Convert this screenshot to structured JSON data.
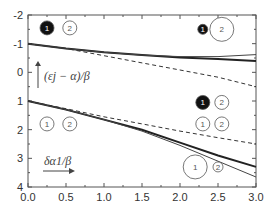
{
  "chart_data": {
    "type": "line",
    "title": "",
    "xlabel": "",
    "ylabel": "",
    "xlim": [
      0.0,
      3.0
    ],
    "ylim": [
      -2,
      4
    ],
    "y_inverted": true,
    "x_ticks": [
      "0.0",
      "0.5",
      "1.0",
      "1.5",
      "2.0",
      "2.5",
      "3.0"
    ],
    "y_ticks": [
      "-2",
      "-1",
      "0",
      "1",
      "2",
      "3",
      "4"
    ],
    "grid": false,
    "series": [
      {
        "name": "upper-thick",
        "style": "solid-thick",
        "x": [
          0,
          0.5,
          1.0,
          1.5,
          2.0,
          2.5,
          3.0
        ],
        "y": [
          -1.0,
          -0.83,
          -0.7,
          -0.6,
          -0.52,
          -0.46,
          -0.4
        ]
      },
      {
        "name": "upper-thin",
        "style": "solid-thin",
        "x": [
          0,
          0.5,
          1.0,
          1.5,
          2.0,
          2.5,
          3.0
        ],
        "y": [
          -1.0,
          -0.83,
          -0.7,
          -0.6,
          -0.55,
          -0.55,
          -0.62
        ]
      },
      {
        "name": "upper-dashed",
        "style": "dashed",
        "x": [
          0,
          0.5,
          1.0,
          1.5,
          2.0,
          2.5,
          3.0
        ],
        "y": [
          -1.0,
          -0.83,
          -0.58,
          -0.33,
          -0.08,
          0.17,
          0.5
        ]
      },
      {
        "name": "lower-thick",
        "style": "solid-thick",
        "x": [
          0,
          0.5,
          1.0,
          1.5,
          2.0,
          2.5,
          3.0
        ],
        "y": [
          1.0,
          1.3,
          1.65,
          2.0,
          2.45,
          2.9,
          3.3
        ]
      },
      {
        "name": "lower-thin",
        "style": "solid-thin",
        "x": [
          0,
          0.5,
          1.0,
          1.5,
          2.0,
          2.5,
          3.0
        ],
        "y": [
          1.0,
          1.3,
          1.65,
          2.05,
          2.55,
          3.1,
          3.65
        ]
      },
      {
        "name": "lower-dashed",
        "style": "dashed",
        "x": [
          0,
          0.5,
          1.0,
          1.5,
          2.0,
          2.5,
          3.0
        ],
        "y": [
          1.0,
          1.27,
          1.55,
          1.8,
          2.05,
          2.28,
          2.5
        ]
      }
    ],
    "annotations": [
      {
        "text": "(ε_j − α)/β",
        "x": 0.3,
        "y": 0.3,
        "arrow": "up"
      },
      {
        "text": "δα_1/β",
        "x": 0.35,
        "y": 3.2,
        "arrow": "right"
      }
    ],
    "orbital_markers": [
      {
        "x": 0.25,
        "y": -1.55,
        "label": "1",
        "filled": true,
        "size": "medium"
      },
      {
        "x": 0.55,
        "y": -1.55,
        "label": "2",
        "filled": false,
        "size": "medium"
      },
      {
        "x": 2.3,
        "y": -1.5,
        "label": "1",
        "filled": true,
        "size": "small"
      },
      {
        "x": 2.55,
        "y": -1.5,
        "label": "2",
        "filled": false,
        "size": "large"
      },
      {
        "x": 2.3,
        "y": 1.05,
        "label": "1",
        "filled": true,
        "size": "medium"
      },
      {
        "x": 2.55,
        "y": 1.05,
        "label": "2",
        "filled": false,
        "size": "medium"
      },
      {
        "x": 0.25,
        "y": 1.8,
        "label": "1",
        "filled": false,
        "size": "medium"
      },
      {
        "x": 0.55,
        "y": 1.8,
        "label": "2",
        "filled": false,
        "size": "medium"
      },
      {
        "x": 2.3,
        "y": 1.8,
        "label": "1",
        "filled": false,
        "size": "medium"
      },
      {
        "x": 2.55,
        "y": 1.8,
        "label": "2",
        "filled": false,
        "size": "medium"
      },
      {
        "x": 2.2,
        "y": 3.3,
        "label": "1",
        "filled": false,
        "size": "large"
      },
      {
        "x": 2.5,
        "y": 3.3,
        "label": "2",
        "filled": false,
        "size": "small"
      }
    ]
  },
  "axis_labels": {
    "y_arrow_label": "(εj − α)/β",
    "x_arrow_label": "δα1/β"
  }
}
